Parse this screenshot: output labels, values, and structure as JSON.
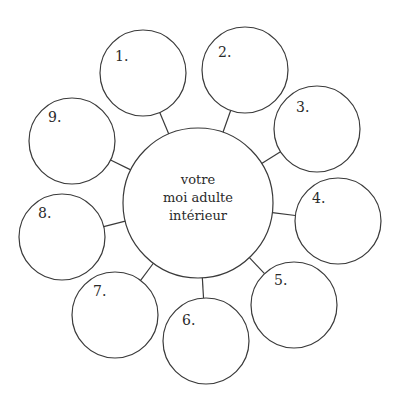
{
  "diagram": {
    "center": {
      "label_lines": [
        "votre",
        "moi adulte",
        "intérieur"
      ],
      "cx": 198,
      "cy": 203,
      "r": 75
    },
    "nodes": [
      {
        "label": "1.",
        "cx": 143,
        "cy": 73,
        "r": 43
      },
      {
        "label": "2.",
        "cx": 245,
        "cy": 70,
        "r": 43
      },
      {
        "label": "3.",
        "cx": 317,
        "cy": 129,
        "r": 43
      },
      {
        "label": "4.",
        "cx": 338,
        "cy": 221,
        "r": 43
      },
      {
        "label": "5.",
        "cx": 294,
        "cy": 305,
        "r": 43
      },
      {
        "label": "6.",
        "cx": 206,
        "cy": 341,
        "r": 43
      },
      {
        "label": "7.",
        "cx": 115,
        "cy": 315,
        "r": 43
      },
      {
        "label": "8.",
        "cx": 62,
        "cy": 237,
        "r": 43
      },
      {
        "label": "9.",
        "cx": 72,
        "cy": 141,
        "r": 43
      }
    ],
    "stroke_color": "#3a3a3a"
  }
}
